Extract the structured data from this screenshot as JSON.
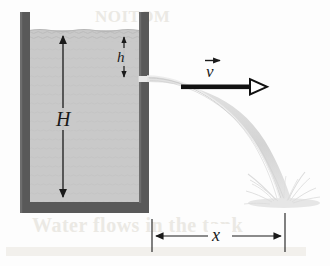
{
  "figure": {
    "caption": "",
    "background_color": "#fdfdfd"
  },
  "tank": {
    "name": "open water tank",
    "wall_color": "#595959",
    "water_color": "#c9c9c9",
    "water_surface_color": "#bdbdbd",
    "left_wall_x": 20,
    "right_wall_x": 146,
    "top_y": 12,
    "bottom_y": 213,
    "wall_thickness": 11
  },
  "labels": {
    "height_total": "H",
    "depth_to_hole": "h",
    "velocity": "v",
    "horizontal_range": "x"
  },
  "dimensions": {
    "H": {
      "label": "H",
      "description": "total height of water from surface to tank bottom",
      "arrow_x": 63,
      "top_y": 32,
      "bottom_y": 200
    },
    "h": {
      "label": "h",
      "description": "depth of the hole below the water surface",
      "arrow_x": 124,
      "top_y": 33,
      "bottom_y": 80
    },
    "x": {
      "label": "x",
      "description": "horizontal distance from tank wall to landing point",
      "left_x": 152,
      "right_x": 285,
      "line_y": 236
    }
  },
  "velocity_vector": {
    "label": "v",
    "arrow_symbol": "vector-arrow",
    "direction": "horizontal right",
    "color": "#111111",
    "start_x": 196,
    "end_x": 268,
    "y": 87
  },
  "stream": {
    "name": "parabolic water jet",
    "color": "#d8d8d8",
    "exit_x": 152,
    "exit_y": 80,
    "landing_x": 283,
    "landing_y": 200
  },
  "splash": {
    "name": "splash spray",
    "color": "#e0e0e0",
    "center_x": 283,
    "center_y": 200
  },
  "colors": {
    "wall": "#595959",
    "water": "#c9c9c9",
    "stream": "#d8d8d8",
    "ink": "#1a1a1a",
    "ghost": "#ebe9e4"
  },
  "ghost_text": {
    "line_top": "NOITOM",
    "line_bottom": "Water flows in the tank"
  }
}
